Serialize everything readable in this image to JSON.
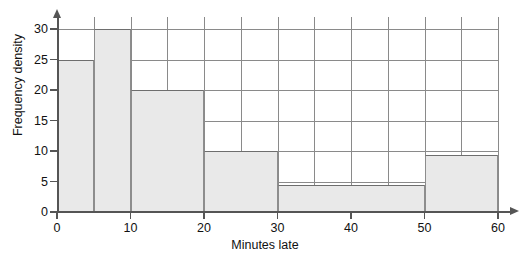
{
  "chart_data": {
    "type": "bar",
    "title": "",
    "subtitle": "",
    "xlabel": "Minutes late",
    "ylabel": "Frequency density",
    "xlim": [
      0,
      60
    ],
    "ylim": [
      0,
      32
    ],
    "grid": true,
    "legend": null,
    "x_major_ticks": [
      0,
      10,
      20,
      30,
      40,
      50,
      60
    ],
    "x_tick_labels": [
      "0",
      "10",
      "20",
      "30",
      "40",
      "50",
      "60"
    ],
    "x_gridline_step": 5,
    "y_ticks": [
      0,
      5,
      10,
      15,
      20,
      25,
      30
    ],
    "y_tick_labels": [
      "0",
      "5",
      "10",
      "15",
      "20",
      "25",
      "30"
    ],
    "y_gridline_step": 5,
    "bins": [
      {
        "label": "0-5",
        "start": 0,
        "end": 5,
        "density": 25
      },
      {
        "label": "5-10",
        "start": 5,
        "end": 10,
        "density": 30
      },
      {
        "label": "10-20",
        "start": 10,
        "end": 20,
        "density": 20
      },
      {
        "label": "20-30",
        "start": 20,
        "end": 30,
        "density": 10
      },
      {
        "label": "30-50",
        "start": 30,
        "end": 50,
        "density": 4.5
      },
      {
        "label": "50-60",
        "start": 50,
        "end": 60,
        "density": 9.3
      }
    ],
    "colors": {
      "bar_fill": "#e9e9e9",
      "bar_edge": "#6e6e6e",
      "grid": "#8a8a8a",
      "axis": "#555555",
      "background": "#ffffff"
    }
  }
}
